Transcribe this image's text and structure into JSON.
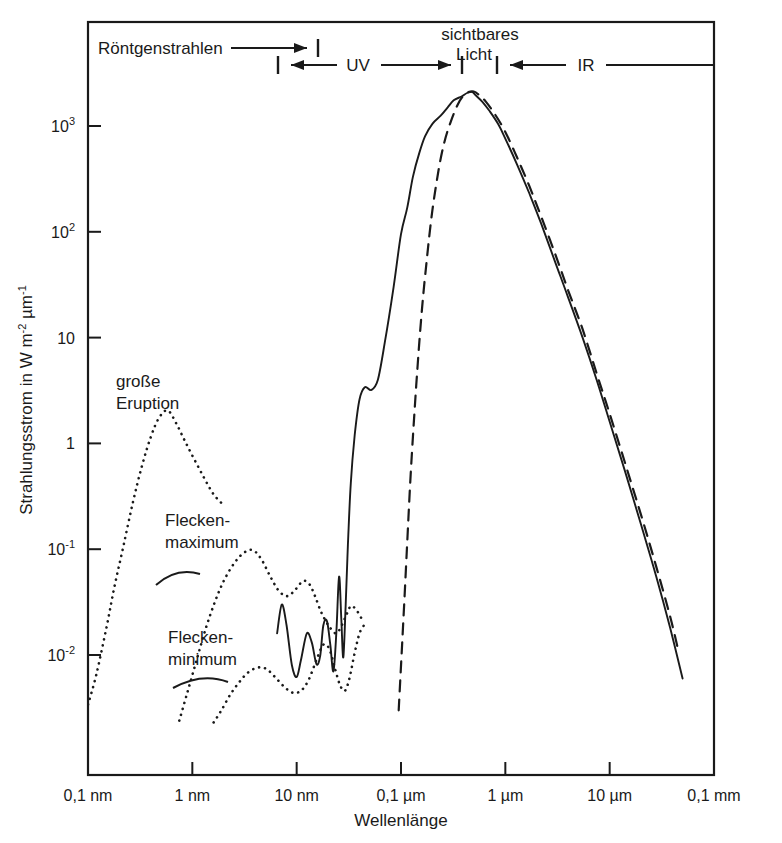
{
  "figure": {
    "background": "#ffffff",
    "ink": "#1a1a1a"
  },
  "axes": {
    "x_title": "Wellenlänge",
    "y_title_parts": {
      "main": "Strahlungsstrom in W  m",
      "exp1": "-2",
      "mid": " µm",
      "exp2": "-1"
    },
    "y_title_plain": "Strahlungsstrom in W m-2 µm-1",
    "x_ticks": [
      {
        "label": "0,1 nm",
        "value": 0.0001
      },
      {
        "label": "1 nm",
        "value": 0.001
      },
      {
        "label": "10 nm",
        "value": 0.01
      },
      {
        "label": "0,1 µm",
        "value": 0.1
      },
      {
        "label": "1 µm",
        "value": 1
      },
      {
        "label": "10 µm",
        "value": 10
      },
      {
        "label": "0,1 mm",
        "value": 100
      }
    ],
    "y_ticks": [
      {
        "mant": "10",
        "exp": "3",
        "value": 1000
      },
      {
        "mant": "10",
        "exp": "2",
        "value": 100
      },
      {
        "mant": "10",
        "exp": "",
        "value": 10
      },
      {
        "mant": "1",
        "exp": "",
        "value": 1
      },
      {
        "mant": "10",
        "exp": "-1",
        "value": 0.1
      },
      {
        "mant": "10",
        "exp": "-2",
        "value": 0.01
      }
    ]
  },
  "spectral_bands": [
    {
      "name": "roentgen",
      "label": "Röntgenstrahlen",
      "arrow": "right-end-bar",
      "from_um": 0.0001,
      "to_um": 0.0085
    },
    {
      "name": "uv",
      "label": "UV",
      "arrow": "double-end-bars",
      "from_um": 0.0045,
      "to_um": 0.38
    },
    {
      "name": "visible",
      "label_line1": "sichtbares",
      "label_line2": "Licht",
      "from_um": 0.38,
      "to_um": 0.78
    },
    {
      "name": "ir",
      "label": "IR",
      "arrow": "left-end-bar",
      "from_um": 0.78,
      "to_um": 100
    }
  ],
  "annotations": [
    {
      "name": "grosse-eruption",
      "line1": "große",
      "line2": "Eruption"
    },
    {
      "name": "fleckenmaximum",
      "line1": "Flecken-",
      "line2": "maximum"
    },
    {
      "name": "fleckenminimum",
      "line1": "Flecken-",
      "line2": "minimum"
    }
  ],
  "chart_data": {
    "type": "line",
    "title": "",
    "xlabel": "Wellenlänge",
    "ylabel": "Strahlungsstrom in W m-2 µm-1",
    "xscale": "log",
    "yscale": "log",
    "xlim": [
      0.0001,
      100
    ],
    "ylim": [
      0.0023,
      6000
    ],
    "xunit": "µm",
    "yunit": "W m^-2 µm^-1",
    "grid": false,
    "legend": "none (curves labelled in place)",
    "series": [
      {
        "name": "Gesamtspektrum (Photosphäre + Korona)",
        "style": "solid",
        "points": [
          [
            0.0065,
            0.016
          ],
          [
            0.0072,
            0.03
          ],
          [
            0.008,
            0.019
          ],
          [
            0.009,
            0.008
          ],
          [
            0.01,
            0.0062
          ],
          [
            0.011,
            0.009
          ],
          [
            0.0125,
            0.016
          ],
          [
            0.014,
            0.013
          ],
          [
            0.0155,
            0.0082
          ],
          [
            0.0168,
            0.0098
          ],
          [
            0.018,
            0.019
          ],
          [
            0.0195,
            0.021
          ],
          [
            0.021,
            0.0125
          ],
          [
            0.0225,
            0.007
          ],
          [
            0.024,
            0.016
          ],
          [
            0.0255,
            0.055
          ],
          [
            0.0268,
            0.022
          ],
          [
            0.028,
            0.0095
          ],
          [
            0.0295,
            0.03
          ],
          [
            0.031,
            0.11
          ],
          [
            0.033,
            0.42
          ],
          [
            0.036,
            1.2
          ],
          [
            0.04,
            2.6
          ],
          [
            0.045,
            3.4
          ],
          [
            0.052,
            3.2
          ],
          [
            0.06,
            4.0
          ],
          [
            0.07,
            9.0
          ],
          [
            0.085,
            30
          ],
          [
            0.1,
            95
          ],
          [
            0.115,
            170
          ],
          [
            0.13,
            330
          ],
          [
            0.15,
            560
          ],
          [
            0.17,
            800
          ],
          [
            0.2,
            1050
          ],
          [
            0.24,
            1250
          ],
          [
            0.28,
            1500
          ],
          [
            0.32,
            1750
          ],
          [
            0.38,
            1900
          ],
          [
            0.43,
            2050
          ],
          [
            0.48,
            2100
          ],
          [
            0.52,
            1950
          ],
          [
            0.6,
            1700
          ],
          [
            0.7,
            1400
          ],
          [
            0.85,
            1050
          ],
          [
            1.0,
            760
          ],
          [
            1.3,
            430
          ],
          [
            1.7,
            230
          ],
          [
            2.2,
            120
          ],
          [
            3.0,
            52
          ],
          [
            4.0,
            24
          ],
          [
            5.5,
            10
          ],
          [
            7.5,
            4.0
          ],
          [
            10.0,
            1.6
          ],
          [
            14.0,
            0.55
          ],
          [
            20.0,
            0.17
          ],
          [
            28.0,
            0.055
          ],
          [
            38.0,
            0.018
          ],
          [
            50.0,
            0.006
          ]
        ]
      },
      {
        "name": "Strahlung des schwarzen Körpers (ca. 5800 K)",
        "style": "dashed",
        "points": [
          [
            0.095,
            0.003
          ],
          [
            0.105,
            0.02
          ],
          [
            0.115,
            0.12
          ],
          [
            0.125,
            0.6
          ],
          [
            0.14,
            3.5
          ],
          [
            0.155,
            14
          ],
          [
            0.175,
            50
          ],
          [
            0.2,
            160
          ],
          [
            0.23,
            390
          ],
          [
            0.26,
            700
          ],
          [
            0.3,
            1100
          ],
          [
            0.35,
            1600
          ],
          [
            0.4,
            1950
          ],
          [
            0.45,
            2100
          ],
          [
            0.5,
            2120
          ],
          [
            0.55,
            2000
          ],
          [
            0.65,
            1700
          ],
          [
            0.8,
            1280
          ],
          [
            1.0,
            880
          ],
          [
            1.3,
            500
          ],
          [
            1.7,
            270
          ],
          [
            2.2,
            140
          ],
          [
            3.0,
            62
          ],
          [
            4.0,
            28
          ],
          [
            5.5,
            12
          ],
          [
            7.5,
            4.6
          ],
          [
            10.0,
            1.9
          ],
          [
            14.0,
            0.66
          ],
          [
            20.0,
            0.21
          ],
          [
            28.0,
            0.068
          ],
          [
            38.0,
            0.023
          ],
          [
            46.0,
            0.0105
          ]
        ]
      },
      {
        "name": "große Eruption",
        "style": "dotted",
        "points": [
          [
            0.0001,
            0.0034
          ],
          [
            0.00012,
            0.0065
          ],
          [
            0.00015,
            0.018
          ],
          [
            0.00018,
            0.045
          ],
          [
            0.00022,
            0.11
          ],
          [
            0.00027,
            0.28
          ],
          [
            0.00033,
            0.62
          ],
          [
            0.0004,
            1.15
          ],
          [
            0.00048,
            1.75
          ],
          [
            0.00058,
            2.05
          ],
          [
            0.0007,
            1.55
          ],
          [
            0.00085,
            1.05
          ],
          [
            0.00105,
            0.7
          ],
          [
            0.0013,
            0.47
          ],
          [
            0.0016,
            0.33
          ],
          [
            0.002,
            0.26
          ]
        ]
      },
      {
        "name": "Fleckenmaximum",
        "style": "dotted",
        "points": [
          [
            0.00075,
            0.0024
          ],
          [
            0.0009,
            0.0045
          ],
          [
            0.0011,
            0.009
          ],
          [
            0.00135,
            0.018
          ],
          [
            0.00165,
            0.032
          ],
          [
            0.002,
            0.05
          ],
          [
            0.0025,
            0.073
          ],
          [
            0.0031,
            0.092
          ],
          [
            0.0038,
            0.098
          ],
          [
            0.0046,
            0.08
          ],
          [
            0.0056,
            0.055
          ],
          [
            0.0068,
            0.04
          ],
          [
            0.0082,
            0.036
          ],
          [
            0.0098,
            0.042
          ],
          [
            0.0115,
            0.05
          ],
          [
            0.0132,
            0.047
          ],
          [
            0.015,
            0.036
          ],
          [
            0.017,
            0.026
          ],
          [
            0.019,
            0.021
          ],
          [
            0.021,
            0.018
          ],
          [
            0.024,
            0.016
          ],
          [
            0.027,
            0.019
          ],
          [
            0.03,
            0.024
          ],
          [
            0.033,
            0.029
          ],
          [
            0.037,
            0.027
          ],
          [
            0.042,
            0.022
          ]
        ]
      },
      {
        "name": "Fleckenminimum",
        "style": "dotted",
        "points": [
          [
            0.0016,
            0.0023
          ],
          [
            0.0019,
            0.003
          ],
          [
            0.0023,
            0.0042
          ],
          [
            0.0028,
            0.0055
          ],
          [
            0.0034,
            0.0068
          ],
          [
            0.0042,
            0.0076
          ],
          [
            0.0051,
            0.0074
          ],
          [
            0.0062,
            0.0062
          ],
          [
            0.0076,
            0.005
          ],
          [
            0.0092,
            0.0044
          ],
          [
            0.011,
            0.0046
          ],
          [
            0.013,
            0.0058
          ],
          [
            0.0155,
            0.009
          ],
          [
            0.018,
            0.0125
          ],
          [
            0.0205,
            0.0115
          ],
          [
            0.023,
            0.0078
          ],
          [
            0.026,
            0.0052
          ],
          [
            0.029,
            0.0046
          ],
          [
            0.032,
            0.006
          ],
          [
            0.036,
            0.0105
          ],
          [
            0.04,
            0.016
          ],
          [
            0.044,
            0.019
          ]
        ]
      }
    ]
  }
}
